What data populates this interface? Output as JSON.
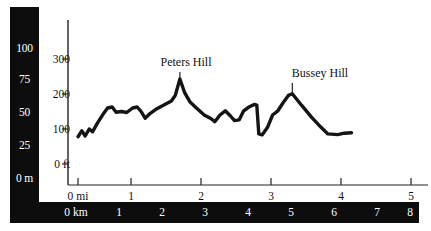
{
  "chart_data": {
    "type": "area",
    "title": "",
    "subtitle": "",
    "xlabel": "",
    "ylabel": "",
    "grid": false,
    "legend_position": "none",
    "axes": {
      "y_primary": {
        "unit": "ft",
        "ticks": [
          0,
          100,
          200,
          300
        ],
        "tick_labels": [
          "0 ft",
          "100",
          "200",
          "300"
        ],
        "ylim": [
          0,
          340
        ]
      },
      "y_secondary": {
        "unit": "m",
        "ticks": [
          0,
          25,
          50,
          75,
          100
        ],
        "tick_labels": [
          "0 m",
          "25",
          "50",
          "75",
          "100"
        ],
        "ylim": [
          0,
          104
        ]
      },
      "x_primary": {
        "unit": "mi",
        "ticks": [
          0,
          1,
          2,
          3,
          4,
          5
        ],
        "tick_labels": [
          "0 mi",
          "1",
          "2",
          "3",
          "4",
          "5"
        ],
        "xlim": [
          0,
          5.2
        ]
      },
      "x_secondary": {
        "unit": "km",
        "ticks": [
          0,
          1,
          2,
          3,
          4,
          5,
          6,
          7,
          8
        ],
        "tick_labels": [
          "0 km",
          "1",
          "2",
          "3",
          "4",
          "5",
          "6",
          "7",
          "8"
        ],
        "xlim": [
          0,
          8.4
        ]
      }
    },
    "series": [
      {
        "name": "Elevation profile",
        "x_unit": "mi",
        "y_unit": "ft",
        "points": [
          [
            0.0,
            78
          ],
          [
            0.06,
            95
          ],
          [
            0.11,
            80
          ],
          [
            0.17,
            100
          ],
          [
            0.22,
            92
          ],
          [
            0.3,
            118
          ],
          [
            0.38,
            142
          ],
          [
            0.45,
            160
          ],
          [
            0.52,
            163
          ],
          [
            0.58,
            148
          ],
          [
            0.66,
            150
          ],
          [
            0.74,
            147
          ],
          [
            0.83,
            160
          ],
          [
            0.9,
            163
          ],
          [
            0.96,
            150
          ],
          [
            1.02,
            131
          ],
          [
            1.1,
            145
          ],
          [
            1.2,
            158
          ],
          [
            1.32,
            170
          ],
          [
            1.42,
            180
          ],
          [
            1.48,
            196
          ],
          [
            1.55,
            243
          ],
          [
            1.62,
            205
          ],
          [
            1.7,
            178
          ],
          [
            1.8,
            160
          ],
          [
            1.92,
            140
          ],
          [
            2.02,
            130
          ],
          [
            2.08,
            121
          ],
          [
            2.16,
            140
          ],
          [
            2.24,
            152
          ],
          [
            2.32,
            137
          ],
          [
            2.38,
            124
          ],
          [
            2.45,
            126
          ],
          [
            2.52,
            152
          ],
          [
            2.6,
            163
          ],
          [
            2.68,
            170
          ],
          [
            2.72,
            168
          ],
          [
            2.75,
            86
          ],
          [
            2.8,
            83
          ],
          [
            2.88,
            104
          ],
          [
            2.96,
            140
          ],
          [
            3.04,
            152
          ],
          [
            3.12,
            175
          ],
          [
            3.2,
            196
          ],
          [
            3.26,
            201
          ],
          [
            3.4,
            168
          ],
          [
            3.56,
            132
          ],
          [
            3.7,
            104
          ],
          [
            3.8,
            86
          ],
          [
            3.95,
            84
          ],
          [
            4.05,
            88
          ],
          [
            4.16,
            89
          ]
        ]
      }
    ],
    "annotations": [
      {
        "label": "Peters Hill",
        "x": 1.55,
        "y": 243,
        "unit_x": "mi",
        "unit_y": "ft"
      },
      {
        "label": "Bussey Hill",
        "x": 3.26,
        "y": 201,
        "unit_x": "mi",
        "unit_y": "ft"
      }
    ]
  },
  "metric_scale": {
    "labels": [
      {
        "text": "100"
      },
      {
        "text": "75"
      },
      {
        "text": "50"
      },
      {
        "text": "25"
      },
      {
        "text": "0 m"
      }
    ]
  },
  "feet_scale": {
    "labels": [
      {
        "text": "300"
      },
      {
        "text": "200"
      },
      {
        "text": "100"
      },
      {
        "text": "0 ft"
      }
    ]
  },
  "mile_scale": {
    "labels": [
      {
        "text": "0 mi"
      },
      {
        "text": "1"
      },
      {
        "text": "2"
      },
      {
        "text": "3"
      },
      {
        "text": "4"
      },
      {
        "text": "5"
      }
    ]
  },
  "km_scale": {
    "labels": [
      {
        "text": "0 km"
      },
      {
        "text": "1"
      },
      {
        "text": "2"
      },
      {
        "text": "3"
      },
      {
        "text": "4"
      },
      {
        "text": "5"
      },
      {
        "text": "6"
      },
      {
        "text": "7"
      },
      {
        "text": "8"
      }
    ]
  },
  "annotations": {
    "peters_hill": "Peters Hill",
    "bussey_hill": "Bussey Hill"
  },
  "colors": {
    "background": "#ffffff",
    "panel": "#0d0d0d",
    "panel_text": "#ffffff",
    "axis": "#222222",
    "profile_line": "#141414",
    "text": "#111111"
  }
}
